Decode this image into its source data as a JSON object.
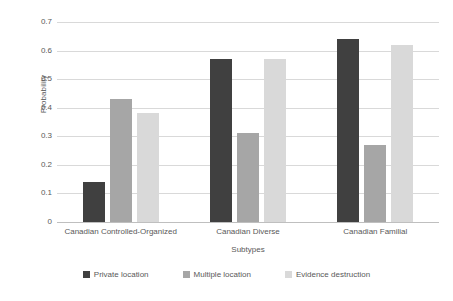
{
  "chart_data": {
    "type": "bar",
    "title": "",
    "xlabel": "Subtypes",
    "ylabel": "Probability",
    "categories": [
      "Canadian Controlled-Organized",
      "Canadian Diverse",
      "Canadian Familial"
    ],
    "series": [
      {
        "name": "Private location",
        "color": "#404040",
        "values": [
          0.14,
          0.57,
          0.64
        ]
      },
      {
        "name": "Multiple location",
        "color": "#a6a6a6",
        "values": [
          0.43,
          0.31,
          0.27
        ]
      },
      {
        "name": "Evidence destruction",
        "color": "#d9d9d9",
        "values": [
          0.38,
          0.57,
          0.62
        ]
      }
    ],
    "ylim": [
      0,
      0.7
    ],
    "ytick_labels": [
      "0.7",
      "0.6",
      "0.5",
      "0.4",
      "0.3",
      "0.2",
      "0.1",
      "0"
    ],
    "ytick_values": [
      0.7,
      0.6,
      0.5,
      0.4,
      0.3,
      0.2,
      0.1,
      0
    ],
    "grid": true,
    "legend_position": "bottom"
  },
  "axes": {
    "y_title": "Probability",
    "x_title": "Subtypes"
  },
  "legend": {
    "items": [
      {
        "label": "Private location",
        "color": "#404040"
      },
      {
        "label": "Multiple location",
        "color": "#a6a6a6"
      },
      {
        "label": "Evidence destruction",
        "color": "#d9d9d9"
      }
    ]
  }
}
